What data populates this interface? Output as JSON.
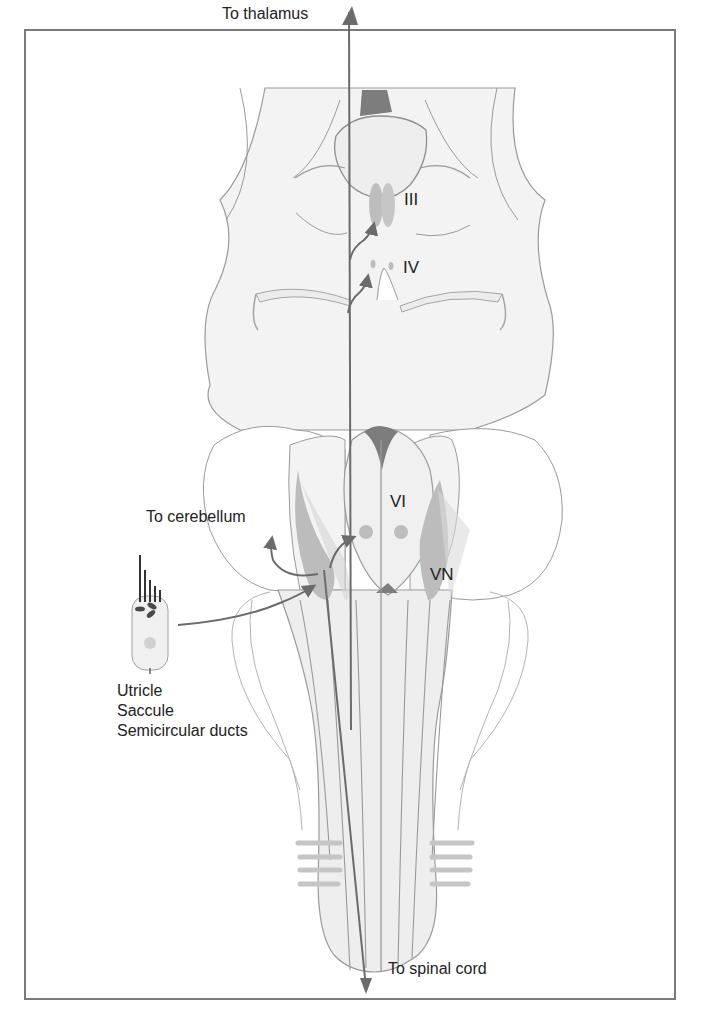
{
  "figure": {
    "labels": {
      "to_thalamus": "To thalamus",
      "to_cerebellum": "To cerebellum",
      "to_spinal_cord": "To spinal cord",
      "nucleus_III": "III",
      "nucleus_IV": "IV",
      "nucleus_VI": "VI",
      "vestibular_nuclei": "VN"
    },
    "sensory_organs": [
      "Utricle",
      "Saccule",
      "Semicircular ducts"
    ],
    "colors": {
      "outline": "#8a8a8a",
      "tissue_fill": "#f1f1f1",
      "nucleus_fill": "#bdbdbd",
      "dark_fill": "#7d7d7d",
      "pathway": "#6b6b6b",
      "frame": "#7a7a7a"
    }
  }
}
